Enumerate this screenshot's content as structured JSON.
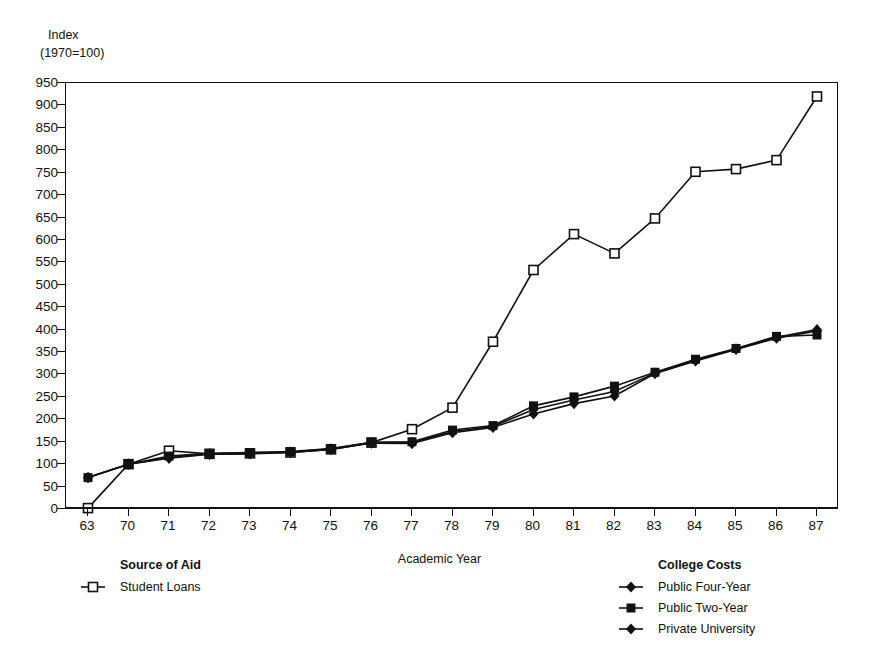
{
  "chart_data": {
    "type": "line",
    "title": "",
    "xlabel": "Academic Year",
    "ylabel_line1": "Index",
    "ylabel_line2": "(1970=100)",
    "categories": [
      "63",
      "70",
      "71",
      "72",
      "73",
      "74",
      "75",
      "76",
      "77",
      "78",
      "79",
      "80",
      "81",
      "82",
      "83",
      "84",
      "85",
      "86",
      "87"
    ],
    "ylim": [
      0,
      950
    ],
    "yticks": [
      0,
      50,
      100,
      150,
      200,
      250,
      300,
      350,
      400,
      450,
      500,
      550,
      600,
      650,
      700,
      750,
      800,
      850,
      900,
      950
    ],
    "grid": false,
    "series": [
      {
        "name": "Student Loans",
        "group": "Source of Aid",
        "marker": "open-square",
        "color": "#111111",
        "values": [
          2,
          100,
          130,
          123,
          124,
          126,
          133,
          148,
          178,
          226,
          373,
          533,
          613,
          570,
          648,
          752,
          758,
          778,
          920
        ]
      },
      {
        "name": "Public Four-Year",
        "group": "College Costs",
        "marker": "filled-diamond",
        "color": "#111111",
        "values": [
          70,
          100,
          113,
          122,
          123,
          126,
          133,
          147,
          146,
          170,
          182,
          212,
          235,
          252,
          302,
          330,
          356,
          381,
          397
        ]
      },
      {
        "name": "Public Two-Year",
        "group": "College Costs",
        "marker": "filled-square",
        "color": "#111111",
        "values": [
          70,
          100,
          118,
          124,
          126,
          128,
          135,
          149,
          150,
          176,
          186,
          230,
          250,
          274,
          305,
          334,
          358,
          385,
          388
        ]
      },
      {
        "name": "Private University",
        "group": "College Costs",
        "marker": "filled-diamond",
        "color": "#111111",
        "values": [
          70,
          100,
          115,
          123,
          124,
          127,
          134,
          148,
          148,
          173,
          184,
          222,
          243,
          262,
          303,
          331,
          357,
          383,
          400
        ]
      }
    ]
  },
  "legends": [
    {
      "title": "Source of Aid",
      "items": [
        {
          "label": "Student Loans",
          "marker": "open-square"
        }
      ]
    },
    {
      "title": "College Costs",
      "items": [
        {
          "label": "Public Four-Year",
          "marker": "filled-diamond"
        },
        {
          "label": "Public Two-Year",
          "marker": "filled-square"
        },
        {
          "label": "Private University",
          "marker": "filled-diamond"
        }
      ]
    }
  ]
}
